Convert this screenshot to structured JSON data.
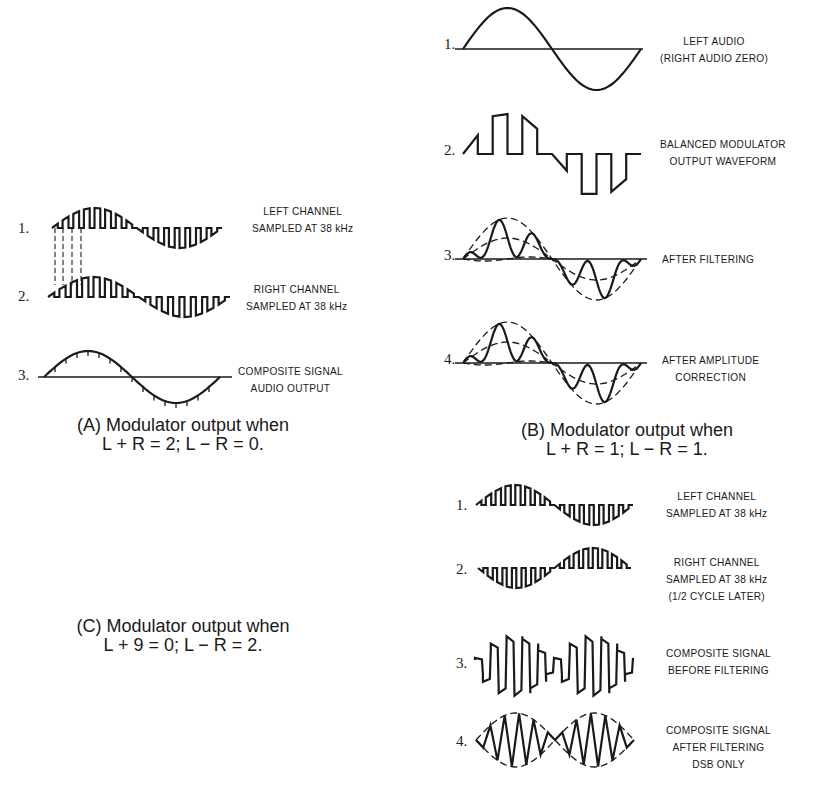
{
  "panel_a": {
    "caption_line1": "(A) Modulator output when",
    "caption_line2": "L + R = 2; L − R = 0.",
    "items": [
      {
        "num": "1.",
        "label_lines": [
          "LEFT CHANNEL",
          "SAMPLED AT 38 kHz"
        ]
      },
      {
        "num": "2.",
        "label_lines": [
          "RIGHT CHANNEL",
          "SAMPLED AT 38 kHz"
        ]
      },
      {
        "num": "3.",
        "label_lines": [
          "COMPOSITE SIGNAL",
          "AUDIO OUTPUT"
        ]
      }
    ]
  },
  "panel_b": {
    "caption_line1": "(B) Modulator output when",
    "caption_line2": "L + R = 1; L − R = 1.",
    "items": [
      {
        "num": "1.",
        "label_lines": [
          "LEFT AUDIO",
          "(RIGHT AUDIO ZERO)"
        ]
      },
      {
        "num": "2.",
        "label_lines": [
          "BALANCED MODULATOR",
          "OUTPUT WAVEFORM"
        ]
      },
      {
        "num": "3.",
        "label_lines": [
          "AFTER FILTERING"
        ]
      },
      {
        "num": "4.",
        "label_lines": [
          "AFTER AMPLITUDE",
          "CORRECTION"
        ]
      }
    ]
  },
  "panel_c": {
    "caption_line1": "(C) Modulator output when",
    "caption_line2": "L + 9 = 0; L − R = 2.",
    "items": [
      {
        "num": "1.",
        "label_lines": [
          "LEFT CHANNEL",
          "SAMPLED AT 38 kHz"
        ]
      },
      {
        "num": "2.",
        "label_lines": [
          "RIGHT CHANNEL",
          "SAMPLED AT 38 kHz",
          "(1/2 CYCLE LATER)"
        ]
      },
      {
        "num": "3.",
        "label_lines": [
          "COMPOSITE SIGNAL",
          "BEFORE FILTERING"
        ]
      },
      {
        "num": "4.",
        "label_lines": [
          "COMPOSITE SIGNAL",
          "AFTER FILTERING",
          "DSB ONLY"
        ]
      }
    ]
  },
  "waveforms": {
    "a1": {
      "type": "sampled",
      "x": 52,
      "y": 228,
      "w": 170,
      "amp": 20,
      "gates": 8,
      "phase": 0
    },
    "a2": {
      "type": "sampled",
      "x": 48,
      "y": 297,
      "w": 182,
      "amp": 20,
      "gates": 8,
      "phase": 0
    },
    "a3": {
      "type": "sine_ticked",
      "x": 44,
      "y": 377,
      "w": 176,
      "amp": 26,
      "ticks": 16
    },
    "b1": {
      "type": "sine",
      "x": 463,
      "y": 49,
      "w": 178,
      "amp": 41
    },
    "b2": {
      "type": "balanced",
      "x": 463,
      "y": 154,
      "w": 178,
      "amp": 42
    },
    "b3": {
      "type": "filtered",
      "x": 463,
      "y": 259,
      "w": 178,
      "amp": 41,
      "inner": 21
    },
    "b4": {
      "type": "corrected",
      "x": 463,
      "y": 363,
      "w": 178,
      "amp": 41,
      "inner": 21
    },
    "c1": {
      "type": "sampled",
      "x": 476,
      "y": 505,
      "w": 157,
      "amp": 20,
      "gates": 8,
      "phase": 0
    },
    "c2": {
      "type": "sampled",
      "x": 478,
      "y": 568,
      "w": 153,
      "amp": 20,
      "gates": 8,
      "phase": 1
    },
    "c3": {
      "type": "composite",
      "x": 475,
      "y": 666,
      "w": 158,
      "amp": 26,
      "gates": 10
    },
    "c4": {
      "type": "dsb",
      "x": 476,
      "y": 740,
      "w": 158,
      "amp": 27,
      "cycles": 11
    }
  }
}
